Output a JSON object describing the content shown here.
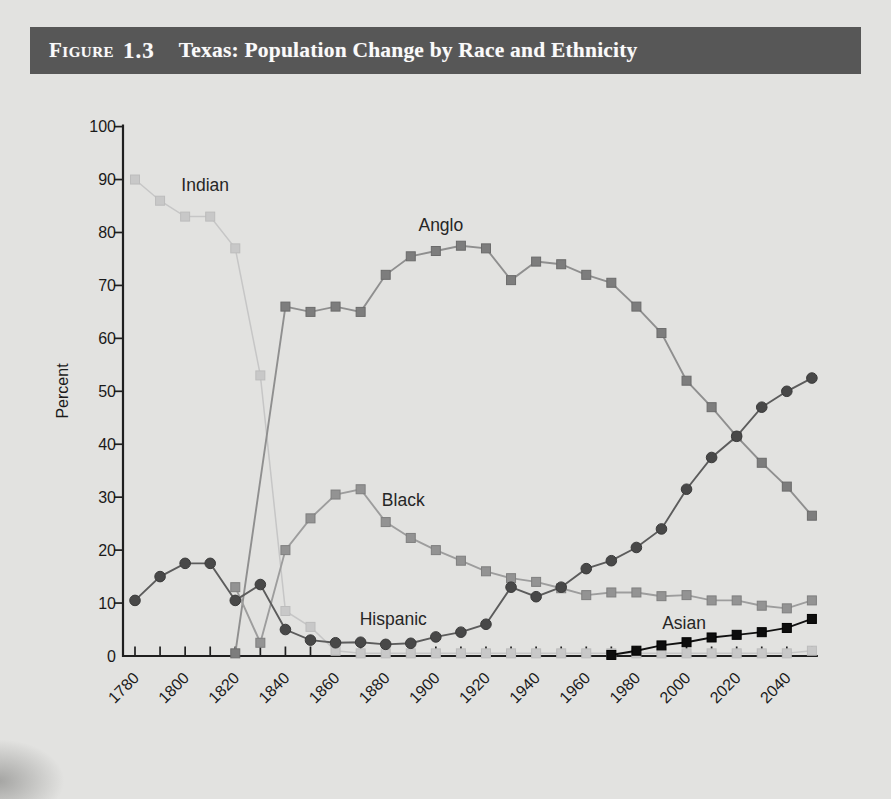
{
  "figure": {
    "label_word": "Figure",
    "number": "1.3",
    "title": "Texas: Population Change by Race and Ethnicity"
  },
  "colors": {
    "page_background": "#e2e2e0",
    "title_bar": "#575757",
    "title_text": "#fafafa",
    "axis": "#1f1f1f",
    "tick_label": "#1a1a1a",
    "series_label": "#262626"
  },
  "chart_data": {
    "type": "line",
    "title": "",
    "xlabel": "",
    "ylabel": "Percent",
    "grid": false,
    "legend_position": "inline-labels",
    "xlim": [
      1780,
      2050
    ],
    "ylim": [
      0,
      100
    ],
    "y_ticks": [
      0,
      10,
      20,
      30,
      40,
      50,
      60,
      70,
      80,
      90,
      100
    ],
    "x_minor_tick_step_years": 10,
    "x_tick_labels": [
      "1780",
      "1800",
      "1820",
      "1840",
      "1860",
      "1880",
      "1900",
      "1920",
      "1940",
      "1960",
      "1980",
      "2000",
      "2020",
      "2040"
    ],
    "x_tick_label_years": [
      1780,
      1800,
      1820,
      1840,
      1860,
      1880,
      1900,
      1920,
      1940,
      1960,
      1980,
      2000,
      2020,
      2040
    ],
    "series": [
      {
        "name": "indian",
        "label": "Indian",
        "marker": "square",
        "fill": "#c8c8c8",
        "edge": "#bcbcbc",
        "line": "#c6c6c6",
        "label_at": [
          1808,
          89
        ],
        "points": [
          [
            1780,
            90
          ],
          [
            1790,
            86
          ],
          [
            1800,
            83
          ],
          [
            1810,
            83
          ],
          [
            1820,
            77
          ],
          [
            1830,
            53
          ],
          [
            1840,
            8.5
          ],
          [
            1850,
            5.5
          ],
          [
            1860,
            1
          ],
          [
            1870,
            0.5
          ],
          [
            1880,
            0.5
          ],
          [
            1890,
            0.5
          ],
          [
            1900,
            0.5
          ],
          [
            1910,
            0.5
          ],
          [
            1920,
            0.5
          ],
          [
            1930,
            0.5
          ],
          [
            1940,
            0.5
          ],
          [
            1950,
            0.5
          ],
          [
            1960,
            0.5
          ],
          [
            1970,
            0.5
          ],
          [
            1980,
            0.5
          ],
          [
            1990,
            0.5
          ],
          [
            2000,
            0.5
          ],
          [
            2010,
            0.5
          ],
          [
            2020,
            0.5
          ],
          [
            2030,
            0.5
          ],
          [
            2040,
            0.5
          ],
          [
            2050,
            1
          ]
        ]
      },
      {
        "name": "anglo",
        "label": "Anglo",
        "marker": "square",
        "fill": "#7d7d7d",
        "edge": "#6b6b6b",
        "line": "#8f8f8f",
        "label_at": [
          1902,
          81.5
        ],
        "points": [
          [
            1820,
            0.5
          ],
          [
            1840,
            66
          ],
          [
            1850,
            65
          ],
          [
            1860,
            66
          ],
          [
            1870,
            65
          ],
          [
            1880,
            72
          ],
          [
            1890,
            75.5
          ],
          [
            1900,
            76.5
          ],
          [
            1910,
            77.5
          ],
          [
            1920,
            77
          ],
          [
            1930,
            71
          ],
          [
            1940,
            74.5
          ],
          [
            1950,
            74
          ],
          [
            1960,
            72
          ],
          [
            1970,
            70.5
          ],
          [
            1980,
            66
          ],
          [
            1990,
            61
          ],
          [
            2000,
            52
          ],
          [
            2010,
            47
          ],
          [
            2020,
            41.5
          ],
          [
            2030,
            36.5
          ],
          [
            2040,
            32
          ],
          [
            2050,
            26.5
          ]
        ]
      },
      {
        "name": "black",
        "label": "Black",
        "marker": "square",
        "fill": "#939393",
        "edge": "#7f7f7f",
        "line": "#9d9d9d",
        "label_at": [
          1887,
          29.5
        ],
        "points": [
          [
            1820,
            13
          ],
          [
            1830,
            2.5
          ],
          [
            1840,
            20
          ],
          [
            1850,
            26
          ],
          [
            1860,
            30.5
          ],
          [
            1870,
            31.5
          ],
          [
            1880,
            25.3
          ],
          [
            1890,
            22.3
          ],
          [
            1900,
            20
          ],
          [
            1910,
            18
          ],
          [
            1920,
            16
          ],
          [
            1930,
            14.7
          ],
          [
            1940,
            14
          ],
          [
            1950,
            12.8
          ],
          [
            1960,
            11.5
          ],
          [
            1970,
            12
          ],
          [
            1980,
            12
          ],
          [
            1990,
            11.3
          ],
          [
            2000,
            11.5
          ],
          [
            2010,
            10.5
          ],
          [
            2020,
            10.5
          ],
          [
            2030,
            9.5
          ],
          [
            2040,
            9
          ],
          [
            2050,
            10.5
          ]
        ]
      },
      {
        "name": "hispanic",
        "label": "Hispanic",
        "marker": "circle",
        "fill": "#484848",
        "edge": "#3a3a3a",
        "line": "#5c5c5c",
        "label_at": [
          1883,
          7
        ],
        "points": [
          [
            1780,
            10.5
          ],
          [
            1790,
            15
          ],
          [
            1800,
            17.5
          ],
          [
            1810,
            17.5
          ],
          [
            1820,
            10.5
          ],
          [
            1830,
            13.5
          ],
          [
            1840,
            5
          ],
          [
            1850,
            3
          ],
          [
            1860,
            2.5
          ],
          [
            1870,
            2.6
          ],
          [
            1880,
            2.2
          ],
          [
            1890,
            2.4
          ],
          [
            1900,
            3.6
          ],
          [
            1910,
            4.5
          ],
          [
            1920,
            6
          ],
          [
            1930,
            13
          ],
          [
            1940,
            11.2
          ],
          [
            1950,
            13
          ],
          [
            1960,
            16.5
          ],
          [
            1970,
            18
          ],
          [
            1980,
            20.5
          ],
          [
            1990,
            24
          ],
          [
            2000,
            31.5
          ],
          [
            2010,
            37.5
          ],
          [
            2020,
            41.5
          ],
          [
            2030,
            47
          ],
          [
            2040,
            50
          ],
          [
            2050,
            52.5
          ]
        ]
      },
      {
        "name": "asian",
        "label": "Asian",
        "marker": "square",
        "fill": "#0d0d0d",
        "edge": "#000000",
        "line": "#111111",
        "label_at": [
          1999,
          6.2
        ],
        "points": [
          [
            1970,
            0.2
          ],
          [
            1980,
            1
          ],
          [
            1990,
            2
          ],
          [
            2000,
            2.6
          ],
          [
            2010,
            3.5
          ],
          [
            2020,
            4
          ],
          [
            2030,
            4.5
          ],
          [
            2040,
            5.3
          ],
          [
            2050,
            7
          ]
        ]
      }
    ]
  }
}
